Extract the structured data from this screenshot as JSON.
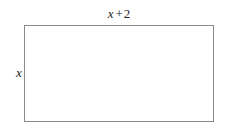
{
  "figure": {
    "type": "rectangle-diagram",
    "background_color": "#ffffff",
    "stroke_color": "#8a8a8a",
    "text_color": "#262626",
    "fill_color": "#ffffff"
  },
  "labels": {
    "width": {
      "full_text": "x + 2",
      "variable": "x",
      "operator": "+",
      "constant": "2",
      "position": "top"
    },
    "height": {
      "full_text": "x",
      "variable": "x",
      "position": "left"
    }
  }
}
